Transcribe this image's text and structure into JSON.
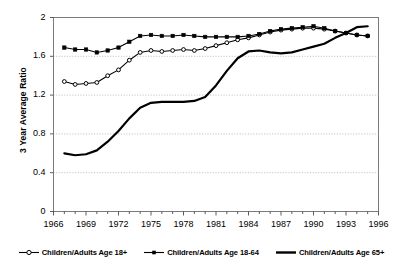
{
  "chart_data": {
    "type": "line",
    "title": "",
    "xlabel": "",
    "ylabel": "3 Year Average Ratio",
    "xlim": [
      1966,
      1996
    ],
    "ylim": [
      0,
      2
    ],
    "xticks": [
      "1966",
      "1969",
      "1972",
      "1975",
      "1978",
      "1981",
      "1984",
      "1987",
      "1990",
      "1993",
      "1996"
    ],
    "yticks": [
      "0",
      "0.4",
      "0.8",
      "1.2",
      "1.6",
      "2"
    ],
    "grid": "horizontal-dotted",
    "legend_position": "bottom",
    "x": [
      1967,
      1968,
      1969,
      1970,
      1971,
      1972,
      1973,
      1974,
      1975,
      1976,
      1977,
      1978,
      1979,
      1980,
      1981,
      1982,
      1983,
      1984,
      1985,
      1986,
      1987,
      1988,
      1989,
      1990,
      1991,
      1992,
      1993,
      1994,
      1995
    ],
    "series": [
      {
        "name": "Children/Adults Age 18+",
        "marker": "open-circle",
        "color": "#000000",
        "values": [
          1.34,
          1.31,
          1.32,
          1.33,
          1.4,
          1.46,
          1.56,
          1.64,
          1.66,
          1.65,
          1.66,
          1.67,
          1.66,
          1.68,
          1.71,
          1.74,
          1.77,
          1.79,
          1.82,
          1.85,
          1.87,
          1.88,
          1.89,
          1.89,
          1.88,
          1.86,
          1.84,
          1.82,
          1.81
        ]
      },
      {
        "name": "Children/Adults Age 18-64",
        "marker": "filled-square",
        "color": "#000000",
        "values": [
          1.69,
          1.67,
          1.67,
          1.64,
          1.66,
          1.69,
          1.75,
          1.81,
          1.82,
          1.81,
          1.81,
          1.82,
          1.81,
          1.8,
          1.8,
          1.8,
          1.8,
          1.81,
          1.83,
          1.86,
          1.88,
          1.89,
          1.9,
          1.91,
          1.89,
          1.86,
          1.84,
          1.82,
          1.81
        ]
      },
      {
        "name": "Children/Adults Age 65+",
        "marker": "none",
        "color": "#000000",
        "values": [
          0.6,
          0.58,
          0.59,
          0.63,
          0.72,
          0.83,
          0.96,
          1.07,
          1.12,
          1.13,
          1.13,
          1.13,
          1.14,
          1.18,
          1.3,
          1.45,
          1.58,
          1.65,
          1.66,
          1.64,
          1.63,
          1.64,
          1.67,
          1.7,
          1.73,
          1.79,
          1.84,
          1.9,
          1.91
        ]
      }
    ]
  },
  "legend": {
    "items": [
      {
        "label": "Children/Adults Age 18+",
        "marker": "open-circle"
      },
      {
        "label": "Children/Adults Age 18-64",
        "marker": "filled-square"
      },
      {
        "label": "Children/Adults Age 65+",
        "marker": "none"
      }
    ]
  }
}
